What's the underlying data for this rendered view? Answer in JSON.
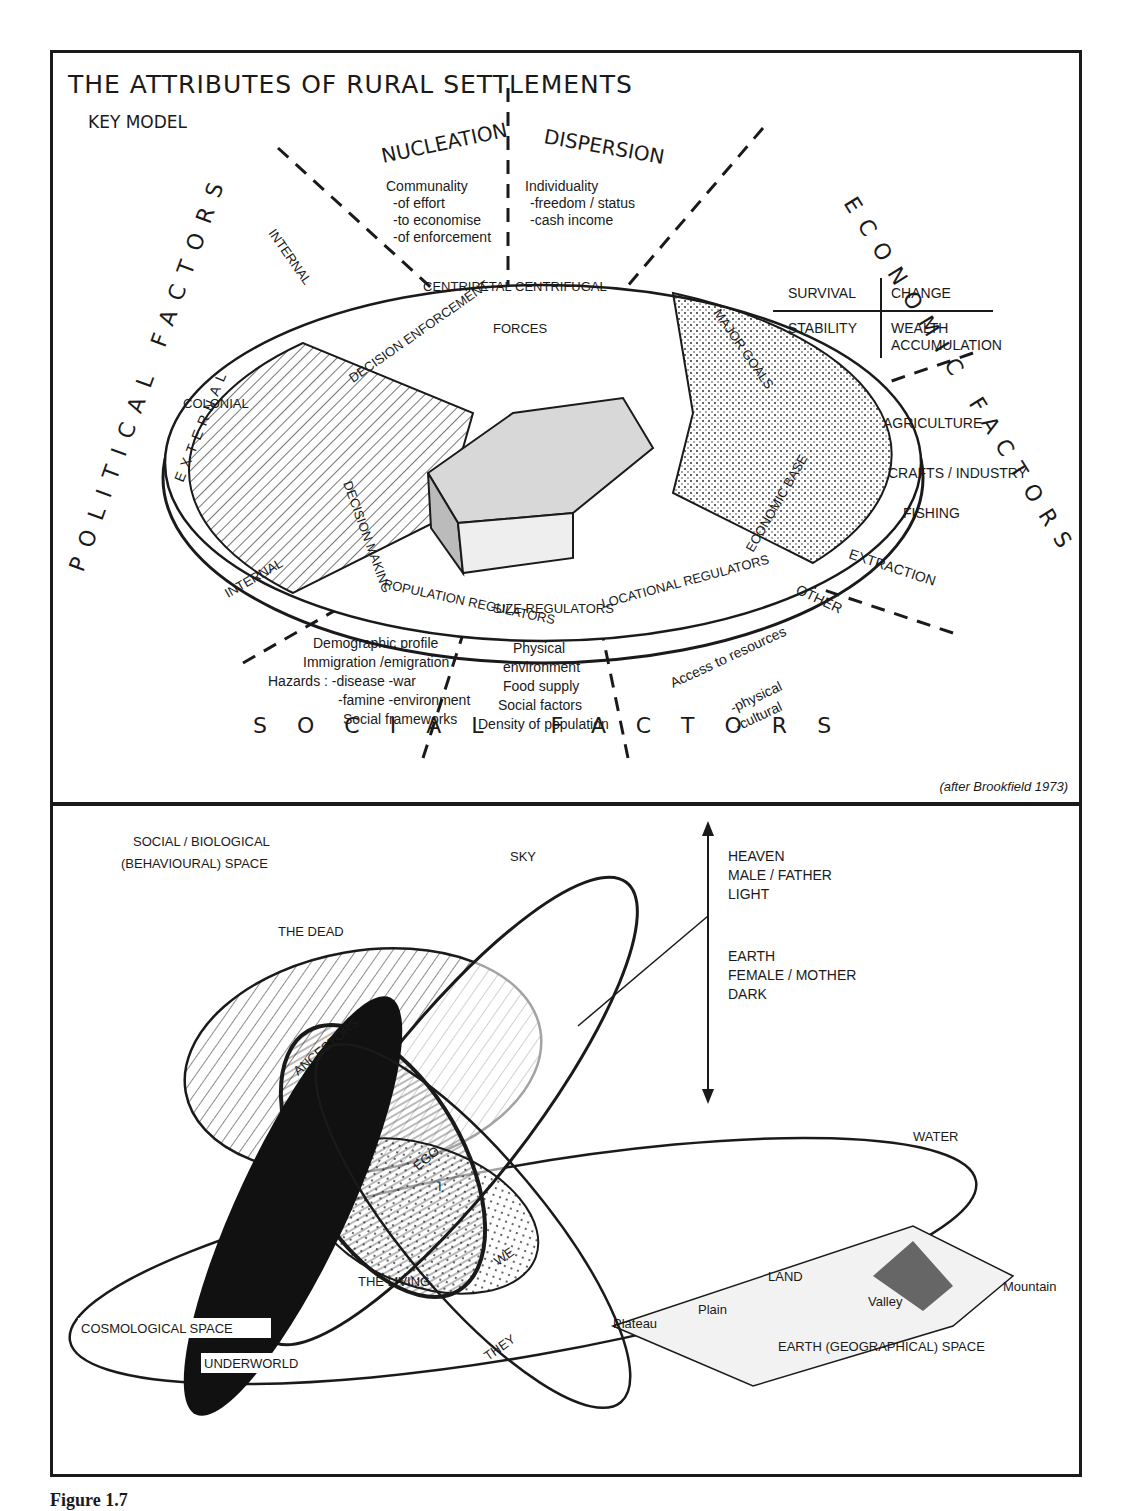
{
  "top_panel": {
    "title": "THE ATTRIBUTES OF RURAL SETTLEMENTS",
    "subtitle": "KEY MODEL",
    "credit": "(after Brookfield 1973)",
    "sectors": {
      "nucleation": "NUCLEATION",
      "dispersion": "DISPERSION",
      "political": "POLITICAL FACTORS",
      "economic": "ECONOMIC FACTORS",
      "social": "SOCIAL FACTORS",
      "external": "EXTERNAL"
    },
    "nucleation_notes": [
      "Communality",
      "-of effort",
      "-to economise",
      "-of enforcement"
    ],
    "dispersion_notes": [
      "Individuality",
      "-freedom / status",
      "-cash income"
    ],
    "forces": {
      "centripetal": "CENTRIPETAL",
      "centrifugal": "CENTRIFUGAL",
      "label": "FORCES"
    },
    "goals_grid": {
      "survival": "SURVIVAL",
      "change": "CHANGE",
      "stability": "STABILITY",
      "wealth": "WEALTH",
      "accumulation": "ACCUMULATION"
    },
    "disc_segments": {
      "decision_enforcement": "DECISION ENFORCEMENT",
      "decision_making": "DECISION MAKING",
      "major_goals": "MAJOR GOALS",
      "economic_base": "ECONOMIC BASE",
      "population_regulators": "POPULATION REGULATORS",
      "size_regulators": "SIZE REGULATORS",
      "locational_regulators": "LOCATIONAL REGULATORS"
    },
    "political_labels": {
      "internal_top": "INTERNAL",
      "colonial": "COLONIAL",
      "internal_bottom": "INTERNAL"
    },
    "economic_labels": [
      "AGRICULTURE",
      "CRAFTS / INDUSTRY",
      "FISHING",
      "EXTRACTION",
      "OTHER"
    ],
    "population_notes": [
      "Demographic profile",
      "Immigration /emigration",
      "Hazards : -disease  -war",
      "-famine  -environment",
      "Social frameworks"
    ],
    "size_notes": [
      "Physical",
      "environment",
      "Food supply",
      "Social factors",
      "Density of population"
    ],
    "location_notes": [
      "Access to resources",
      "-physical",
      "-cultural"
    ]
  },
  "bottom_panel": {
    "social_space": [
      "SOCIAL / BIOLOGICAL",
      "(BEHAVIOURAL) SPACE"
    ],
    "axis_top": [
      "HEAVEN",
      "MALE / FATHER",
      "LIGHT"
    ],
    "axis_bottom": [
      "EARTH",
      "FEMALE / MOTHER",
      "DARK"
    ],
    "labels": {
      "sky": "SKY",
      "the_dead": "THE DEAD",
      "ancestors": "ANCESTORS",
      "ego": "EGO",
      "i": "I",
      "we": "WE",
      "the_living": "THE LIVING",
      "they": "THEY",
      "water": "WATER",
      "mountain": "Mountain",
      "land": "LAND",
      "valley": "Valley",
      "plain": "Plain",
      "plateau": "Plateau",
      "earth_space": "EARTH (GEOGRAPHICAL) SPACE",
      "cosmological": "COSMOLOGICAL SPACE",
      "underworld": "UNDERWORLD"
    }
  },
  "caption": "Figure 1.7"
}
